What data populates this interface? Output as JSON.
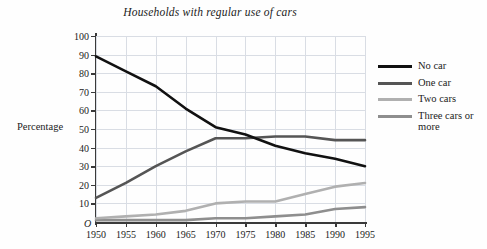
{
  "chart_data": {
    "type": "line",
    "title": "Households with regular use of cars",
    "xlabel": "",
    "ylabel": "Percentage",
    "xlim": [
      1950,
      1995
    ],
    "ylim": [
      0,
      100
    ],
    "grid": true,
    "legend_position": "right",
    "origin_marker": "O",
    "x": [
      1950,
      1955,
      1960,
      1965,
      1970,
      1975,
      1980,
      1985,
      1990,
      1995
    ],
    "xticklabels": [
      "1950",
      "1955",
      "1960",
      "1965",
      "1970",
      "1975",
      "1980",
      "1985",
      "1990",
      "1995"
    ],
    "yticks": [
      10,
      20,
      30,
      40,
      50,
      60,
      70,
      80,
      90,
      100
    ],
    "yticklabels": [
      "10",
      "20",
      "30",
      "40",
      "50",
      "60",
      "70",
      "80",
      "90",
      "100"
    ],
    "series": [
      {
        "name": "No car",
        "color": "#111111",
        "values": [
          89,
          81,
          73,
          61,
          51,
          47,
          41,
          37,
          34,
          30
        ]
      },
      {
        "name": "One car",
        "color": "#555555",
        "values": [
          13,
          21,
          30,
          38,
          45,
          45,
          46,
          46,
          44,
          44
        ]
      },
      {
        "name": "Two cars",
        "color": "#b0b0b0",
        "values": [
          2,
          3,
          4,
          6,
          10,
          11,
          11,
          15,
          19,
          21
        ]
      },
      {
        "name": "Three cars or more",
        "color": "#8e8e8e",
        "values": [
          1,
          1,
          1,
          1,
          2,
          2,
          3,
          4,
          7,
          8
        ]
      }
    ]
  },
  "legend": {
    "items": [
      {
        "label": "No car",
        "color": "#111111"
      },
      {
        "label": "One car",
        "color": "#555555"
      },
      {
        "label": "Two cars",
        "color": "#b0b0b0"
      },
      {
        "label": "Three cars or more",
        "color": "#8e8e8e"
      }
    ]
  }
}
